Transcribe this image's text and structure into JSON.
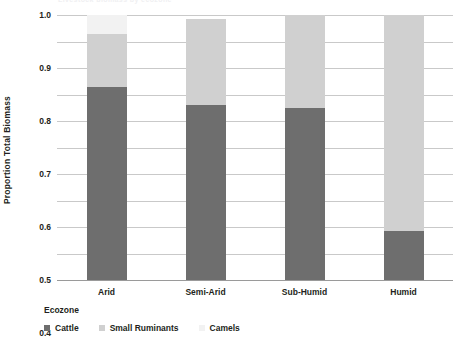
{
  "clipped_title": "Livestock biomass by ecozone",
  "chart_data": {
    "type": "bar",
    "stacked": true,
    "normalized": true,
    "title": "",
    "xlabel": "Ecozone",
    "ylabel": "Proportion Total  Biomass",
    "ylim": [
      0,
      1.0
    ],
    "grid": true,
    "legend_position": "bottom-left",
    "categories": [
      "Arid",
      "Semi-Arid",
      "Sub-Humid",
      "Humid"
    ],
    "ytick_labels": [
      "1.0",
      "0.9",
      "0.8",
      "0.7",
      "0.6",
      "0.5",
      "0.4",
      "0.3",
      "0.2",
      "0.1",
      "0"
    ],
    "ytick_values": [
      1.0,
      0.9,
      0.8,
      0.7,
      0.6,
      0.5,
      0.4,
      0.3,
      0.2,
      0.1,
      0
    ],
    "series": [
      {
        "name": "Cattle",
        "color": "#6e6e6e",
        "values": [
          0.73,
          0.66,
          0.65,
          0.185
        ]
      },
      {
        "name": "Small Ruminants",
        "color": "#d0d0d0",
        "values": [
          0.2,
          0.325,
          0.35,
          0.815
        ]
      },
      {
        "name": "Camels",
        "color": "#f2f2f2",
        "values": [
          0.07,
          0.0,
          0.0,
          0.0
        ]
      }
    ],
    "bar_totals": [
      1.0,
      0.985,
      1.0,
      1.0
    ]
  },
  "colors": {
    "gridline": "#c9c9c9",
    "axis": "#9a9a9a",
    "text": "#231f20",
    "background": "#ffffff"
  }
}
